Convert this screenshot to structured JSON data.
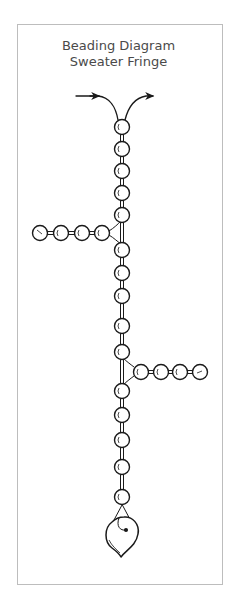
{
  "title": {
    "line1": "Beading Diagram",
    "line2": "Sweater Fringe"
  },
  "diagram": {
    "stroke_color": "#1a1a1a",
    "frame_color": "#bdbdbd",
    "main_stem_x": 122,
    "main_stem_bead_count": 18,
    "left_branch_bead_count": 4,
    "right_branch_bead_count": 4,
    "pendant": "leaf",
    "thread_direction_arrows": [
      "in-left",
      "out-right"
    ]
  }
}
